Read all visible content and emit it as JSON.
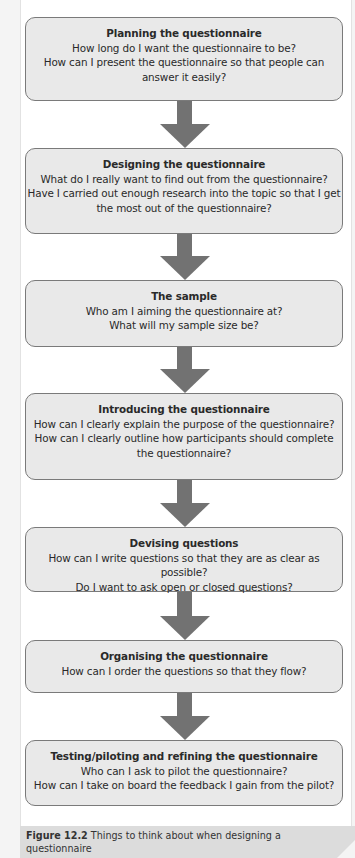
{
  "flowchart": {
    "steps": [
      {
        "title": "Planning the questionnaire",
        "lines": [
          "How long do I want the questionnaire to be?",
          "How can I present the questionnaire so that people can",
          "answer it easily?"
        ]
      },
      {
        "title": "Designing the questionnaire",
        "lines": [
          "What do I really want to find out from the questionnaire?",
          "Have I carried out enough research into the topic so that I get",
          "the most out of the questionnaire?"
        ]
      },
      {
        "title": "The sample",
        "lines": [
          "Who am I aiming the questionnaire at?",
          "What will my sample size be?"
        ]
      },
      {
        "title": "Introducing the questionnaire",
        "lines": [
          "How can I clearly explain the purpose of the questionnaire?",
          "How can I clearly outline how participants should complete",
          "the questionnaire?"
        ]
      },
      {
        "title": "Devising questions",
        "lines": [
          "How can I write questions so that they are as clear as possible?",
          "Do I want to ask open or closed questions?"
        ]
      },
      {
        "title": "Organising the questionnaire",
        "lines": [
          "How can I order the questions so that they flow?"
        ]
      },
      {
        "title": "Testing/piloting and refining the questionnaire",
        "lines": [
          "Who can I ask to pilot the questionnaire?",
          "How can I take on board the feedback I gain from the pilot?"
        ]
      }
    ],
    "arrow_icon": "down-arrow-icon",
    "colors": {
      "box_fill": "#e9e9e9",
      "box_border": "#7a7a7a",
      "arrow": "#727272",
      "caption_bg": "#dcdcdc"
    }
  },
  "caption": {
    "figure_label": "Figure 12.2",
    "text": " Things to think about when designing a questionnaire"
  }
}
